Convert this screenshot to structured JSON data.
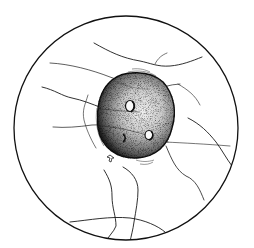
{
  "figure": {
    "title": "Microscope field of view: single spherical cell with surface pits among fibers",
    "background": "#ffffff",
    "ink": "#1a1a1a",
    "field": {
      "cx": 126,
      "cy": 128,
      "r": 112
    },
    "cell": {
      "cx": 136,
      "cy": 115,
      "rx": 39,
      "ry": 43
    },
    "pits": 3,
    "arrow_marker": true
  }
}
